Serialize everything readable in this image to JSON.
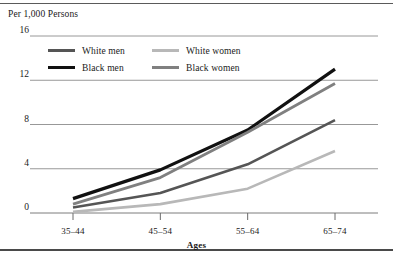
{
  "figure": {
    "y_axis_title": "Per 1,000 Persons",
    "x_axis_label": "Ages"
  },
  "chart_data": {
    "type": "line",
    "title": "",
    "subtitle": "",
    "ylabel": "Per 1,000 Persons",
    "xlabel": "Ages",
    "categories": [
      "35–44",
      "45–54",
      "55–64",
      "65–74"
    ],
    "yticks": [
      0,
      4,
      8,
      12,
      16
    ],
    "ytick_labels": [
      "0",
      "4",
      "8",
      "12",
      "16"
    ],
    "ylim": [
      0,
      16
    ],
    "grid": "horizontal",
    "legend_position": "top-left-inside",
    "series": [
      {
        "name": "White men",
        "color": "#555555",
        "values": [
          0.5,
          1.8,
          4.4,
          8.4
        ]
      },
      {
        "name": "White women",
        "color": "#b8b8b8",
        "values": [
          0.1,
          0.8,
          2.2,
          5.6
        ]
      },
      {
        "name": "Black men",
        "color": "#111111",
        "values": [
          1.3,
          3.9,
          7.5,
          13.0
        ]
      },
      {
        "name": "Black women",
        "color": "#808080",
        "values": [
          0.8,
          3.2,
          7.3,
          11.7
        ]
      }
    ]
  },
  "legend": {
    "entries": [
      {
        "label": "White men"
      },
      {
        "label": "White women"
      },
      {
        "label": "Black men"
      },
      {
        "label": "Black women"
      }
    ]
  }
}
